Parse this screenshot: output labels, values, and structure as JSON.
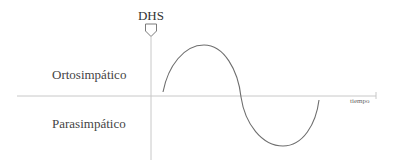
{
  "diagram": {
    "marker_label": "DHS",
    "upper_region_label": "Ortosimpático",
    "lower_region_label": "Parasimpático",
    "x_axis_label": "tiempo",
    "curve": {
      "type": "sine",
      "description": "One full sine cycle starting just after the DHS marker: rises into the Ortosimpático region, crosses the time axis, and dips into the Parasimpático region",
      "start": [
        163,
        92
      ],
      "peak": [
        204,
        45
      ],
      "zero_crossing": [
        241,
        97
      ],
      "trough": [
        283,
        146
      ],
      "end": [
        319,
        100
      ]
    },
    "colors": {
      "axis": "#c8c8c8",
      "curve": "#6e6e6e",
      "text": "#3a3a3a"
    }
  }
}
